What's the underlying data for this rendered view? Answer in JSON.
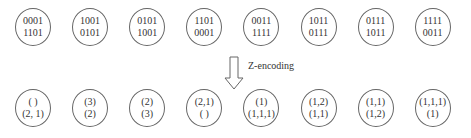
{
  "top_row": [
    {
      "line1": "0001",
      "line2": "1101"
    },
    {
      "line1": "1001",
      "line2": "0101"
    },
    {
      "line1": "0101",
      "line2": "1001"
    },
    {
      "line1": "1101",
      "line2": "0001"
    },
    {
      "line1": "0011",
      "line2": "1111"
    },
    {
      "line1": "1011",
      "line2": "0111"
    },
    {
      "line1": "0111",
      "line2": "1011"
    },
    {
      "line1": "1111",
      "line2": "0011"
    }
  ],
  "bottom_row": [
    {
      "line1": "( )",
      "line2": "(2, 1)"
    },
    {
      "line1": "(3)",
      "line2": "(2)"
    },
    {
      "line1": "(2)",
      "line2": "(3)"
    },
    {
      "line1": "(2,1)",
      "line2": "( )"
    },
    {
      "line1": "(1)",
      "line2": "(1,1,1)"
    },
    {
      "line1": "(1,2)",
      "line2": "(1,1)"
    },
    {
      "line1": "(1,1)",
      "line2": "(1,2)"
    },
    {
      "line1": "(1,1,1)",
      "line2": "(1)"
    }
  ],
  "arrow_label": "Z-encoding"
}
